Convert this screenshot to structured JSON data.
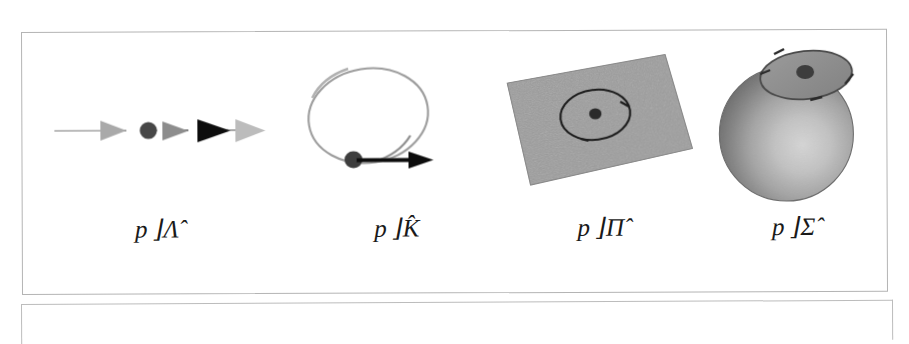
{
  "figure": {
    "background_color": "#ffffff",
    "frame_border_color": "#b4b4b4",
    "panel_count": 4,
    "panels": [
      {
        "id": "panel-lambda",
        "label": "p ⌋Λ̂",
        "label_base": "p",
        "label_operator": "⌋",
        "label_symbol": "Λ",
        "label_accent": "hat",
        "diagram": "line-with-arrowheads",
        "diagram_description": "Horizontal straight line (1-dimensional manifold) carrying a point (black dot) and a sequence of arrowheads of varying darkness pointing to the right.",
        "elements": [
          {
            "name": "base-line",
            "kind": "line",
            "color": "#9a9a9a"
          },
          {
            "name": "arrowhead-1",
            "kind": "arrowhead",
            "color": "#a8a8a8"
          },
          {
            "name": "point-p",
            "kind": "dot",
            "color": "#444444"
          },
          {
            "name": "arrowhead-2",
            "kind": "arrowhead",
            "color": "#8c8c8c"
          },
          {
            "name": "arrowhead-3",
            "kind": "arrowhead",
            "color": "#111111"
          },
          {
            "name": "arrowhead-4",
            "kind": "arrowhead",
            "color": "#b8b8b8"
          }
        ]
      },
      {
        "id": "panel-k",
        "label": "p ⌋K̂",
        "label_base": "p",
        "label_operator": "⌋",
        "label_symbol": "K",
        "label_accent": "hat",
        "diagram": "closed-loop-with-tangent-vector",
        "diagram_description": "A tilted closed loop (ellipse) drawn in light grey, with a black point on the lower arc and a heavy black tangent arrow pointing right.",
        "elements": [
          {
            "name": "loop-curve",
            "kind": "ellipse-outline",
            "color": "#9e9e9e"
          },
          {
            "name": "point-p",
            "kind": "dot",
            "color": "#3b3b3b"
          },
          {
            "name": "tangent-arrow",
            "kind": "arrow",
            "color": "#0d0d0d"
          }
        ]
      },
      {
        "id": "panel-pi",
        "label": "p ⌋Π̂",
        "label_base": "p",
        "label_operator": "⌋",
        "label_symbol": "Π",
        "label_accent": "hat",
        "diagram": "shaded-plane-with-circle",
        "diagram_description": "A grey shaded parallelogram representing a plane seen in perspective, with a dark circle drawn on it and a dark point at its centre.",
        "elements": [
          {
            "name": "plane-surface",
            "kind": "parallelogram",
            "color": "#969696"
          },
          {
            "name": "circle-outline",
            "kind": "ellipse-outline",
            "color": "#1f1f1f"
          },
          {
            "name": "point-p",
            "kind": "dot",
            "color": "#2b2b2b"
          }
        ]
      },
      {
        "id": "panel-sigma",
        "label": "p ⌋Σ̂",
        "label_base": "p",
        "label_operator": "⌋",
        "label_symbol": "Σ",
        "label_accent": "hat",
        "diagram": "shaded-sphere-with-tangent-disk",
        "diagram_description": "A shaded sphere with a grey elliptical tangent disk resting on its upper surface and a dark point on the disk.",
        "elements": [
          {
            "name": "sphere-body",
            "kind": "sphere",
            "color": "#808080"
          },
          {
            "name": "tangent-disk",
            "kind": "ellipse",
            "color": "#8f8f8f"
          },
          {
            "name": "point-p",
            "kind": "dot",
            "color": "#3a3a3a"
          }
        ]
      }
    ]
  }
}
